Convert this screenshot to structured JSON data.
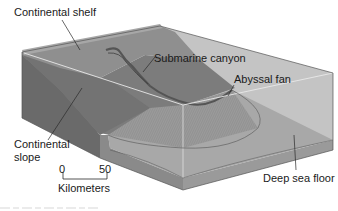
{
  "diagram": {
    "type": "block-diagram",
    "labels": {
      "continental_shelf": "Continental shelf",
      "submarine_canyon": "Submarine canyon",
      "abyssal_fan": "Abyssal fan",
      "continental_slope_line1": "Continental",
      "continental_slope_line2": "slope",
      "deep_sea_floor": "Deep sea floor"
    },
    "scale_bar": {
      "start": "0",
      "end": "50",
      "unit": "Kilometers"
    },
    "colors": {
      "shelf_top": "#8f8f8f",
      "slope_top": "#7a7a7a",
      "front_face_dark": "#6b6b6b",
      "fan": "#9c9c9c",
      "deep_floor": "#a9a9a9",
      "right_wall": "#c4c4c4",
      "slab_side": "#8c8c8c",
      "edge_highlight": "#e6e6e6",
      "leader_line": "#2a2a2a"
    }
  }
}
